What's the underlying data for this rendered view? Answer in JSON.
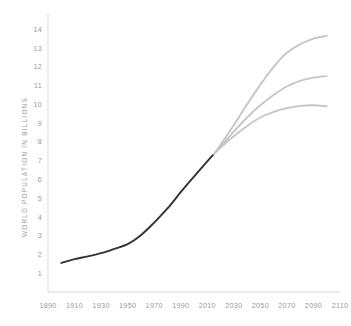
{
  "chart_data": {
    "type": "line",
    "title": "",
    "xlabel": "",
    "ylabel": "WORLD POPULATION IN BILLIONS",
    "xlim": [
      1890,
      2110
    ],
    "ylim": [
      0,
      14.6
    ],
    "grid": false,
    "legend_position": "none",
    "x_ticks": [
      "1890",
      "1910",
      "1930",
      "1950",
      "1970",
      "1990",
      "2010",
      "2030",
      "2050",
      "2070",
      "2090",
      "2110"
    ],
    "y_ticks": [
      "1",
      "2",
      "3",
      "4",
      "5",
      "6",
      "7",
      "8",
      "9",
      "10",
      "11",
      "12",
      "13",
      "14"
    ],
    "colors": {
      "history": "#333333",
      "projection": "#c6c6c6",
      "axis": "#d2d2d2",
      "text": "#9a9a9a",
      "background": "#ffffff"
    },
    "series": [
      {
        "name": "Historical population",
        "style": "history",
        "color": "#333333",
        "x": [
          1900,
          1910,
          1920,
          1930,
          1940,
          1950,
          1960,
          1970,
          1980,
          1990,
          2000,
          2010,
          2015
        ],
        "values": [
          1.55,
          1.75,
          1.9,
          2.07,
          2.3,
          2.55,
          3.03,
          3.7,
          4.45,
          5.32,
          6.15,
          6.96,
          7.35
        ]
      },
      {
        "name": "High projection",
        "style": "projection",
        "color": "#c6c6c6",
        "x": [
          2015,
          2020,
          2030,
          2040,
          2050,
          2060,
          2070,
          2080,
          2090,
          2100
        ],
        "values": [
          7.35,
          7.85,
          8.9,
          10.0,
          11.05,
          12.0,
          12.75,
          13.2,
          13.5,
          13.65
        ]
      },
      {
        "name": "Medium projection",
        "style": "projection",
        "color": "#c6c6c6",
        "x": [
          2015,
          2020,
          2030,
          2040,
          2050,
          2060,
          2070,
          2080,
          2090,
          2100
        ],
        "values": [
          7.35,
          7.75,
          8.55,
          9.3,
          9.95,
          10.5,
          10.95,
          11.25,
          11.42,
          11.5
        ]
      },
      {
        "name": "Low projection",
        "style": "projection",
        "color": "#c6c6c6",
        "x": [
          2015,
          2020,
          2030,
          2040,
          2050,
          2060,
          2070,
          2080,
          2090,
          2100
        ],
        "values": [
          7.35,
          7.7,
          8.3,
          8.85,
          9.3,
          9.6,
          9.8,
          9.92,
          9.95,
          9.9
        ]
      }
    ]
  }
}
